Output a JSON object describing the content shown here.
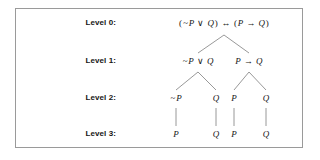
{
  "figure": {
    "type": "parse-tree",
    "border_color": "#9a9a9a",
    "background_color": "#ffffff",
    "text_color": "#161616",
    "edge_color": "#8c8c8c"
  },
  "levels": [
    {
      "label": "Level 0:",
      "y": 13
    },
    {
      "label": "Level 1:",
      "y": 51
    },
    {
      "label": "Level 2:",
      "y": 88
    },
    {
      "label": "Level 3:",
      "y": 124
    }
  ],
  "nodes": {
    "level0": [
      {
        "text": "(~P ∨ Q) ↔ (P → Q)",
        "x": 208,
        "y": 13
      }
    ],
    "level1": [
      {
        "text": "~P ∨ Q",
        "x": 182,
        "y": 51
      },
      {
        "text": "P → Q",
        "x": 233,
        "y": 51
      }
    ],
    "level2": [
      {
        "text": "~P",
        "x": 160,
        "y": 88
      },
      {
        "text": "Q",
        "x": 200,
        "y": 88
      },
      {
        "text": "P",
        "x": 218,
        "y": 88
      },
      {
        "text": "Q",
        "x": 250,
        "y": 88
      }
    ],
    "level3": [
      {
        "text": "P",
        "x": 160,
        "y": 124
      },
      {
        "text": "Q",
        "x": 200,
        "y": 124
      },
      {
        "text": "P",
        "x": 218,
        "y": 124
      },
      {
        "text": "Q",
        "x": 250,
        "y": 124
      }
    ]
  },
  "edges": [
    {
      "from": "level0-root",
      "to": "level1-left",
      "x1": 208,
      "y1": 26,
      "x2": 182,
      "y2": 44
    },
    {
      "from": "level0-root",
      "to": "level1-right",
      "x1": 208,
      "y1": 26,
      "x2": 233,
      "y2": 44
    },
    {
      "from": "level1-left",
      "to": "level2-a",
      "x1": 182,
      "y1": 63,
      "x2": 160,
      "y2": 81
    },
    {
      "from": "level1-left",
      "to": "level2-b",
      "x1": 182,
      "y1": 63,
      "x2": 200,
      "y2": 81
    },
    {
      "from": "level1-right",
      "to": "level2-c",
      "x1": 233,
      "y1": 63,
      "x2": 218,
      "y2": 81
    },
    {
      "from": "level1-right",
      "to": "level2-d",
      "x1": 233,
      "y1": 63,
      "x2": 250,
      "y2": 81
    },
    {
      "from": "level2-a",
      "to": "level3-a",
      "x1": 160,
      "y1": 99,
      "x2": 160,
      "y2": 117
    },
    {
      "from": "level2-b",
      "to": "level3-b",
      "x1": 200,
      "y1": 99,
      "x2": 200,
      "y2": 117
    },
    {
      "from": "level2-c",
      "to": "level3-c",
      "x1": 218,
      "y1": 99,
      "x2": 218,
      "y2": 117
    },
    {
      "from": "level2-d",
      "to": "level3-d",
      "x1": 250,
      "y1": 99,
      "x2": 250,
      "y2": 117
    }
  ]
}
